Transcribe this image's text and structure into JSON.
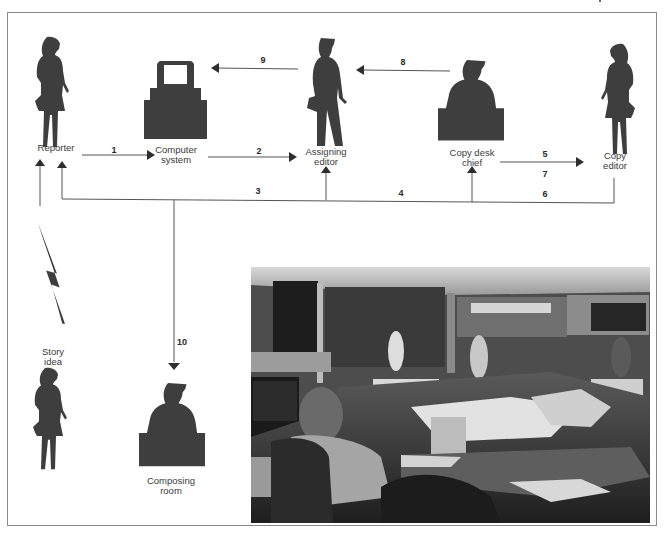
{
  "diagram": {
    "title": "",
    "colors": {
      "figure": "#3e3e3e",
      "line": "#555555",
      "border": "#8a8a8a"
    },
    "nodes": [
      {
        "id": "reporter",
        "label": "Reporter",
        "icon": "woman-silhouette"
      },
      {
        "id": "computer",
        "label": "Computer\nsystem",
        "icon": "computer-terminal"
      },
      {
        "id": "assigning",
        "label": "Assigning\neditor",
        "icon": "man-silhouette"
      },
      {
        "id": "copychief",
        "label": "Copy desk\nchief",
        "icon": "man-at-desk"
      },
      {
        "id": "copyeditor",
        "label": "Copy\neditor",
        "icon": "woman-silhouette"
      },
      {
        "id": "story",
        "label": "Story\nidea",
        "icon": "lightning-bolt"
      },
      {
        "id": "composing",
        "label": "Composing\nroom",
        "icon": "man-at-desk"
      }
    ],
    "edges": [
      {
        "num": "1",
        "from": "Reporter",
        "to": "Computer system"
      },
      {
        "num": "2",
        "from": "Computer system",
        "to": "Assigning editor"
      },
      {
        "num": "3",
        "from": "Assigning editor",
        "to": "Reporter"
      },
      {
        "num": "4",
        "from": "Copy desk chief",
        "to": "Reporter"
      },
      {
        "num": "5",
        "from": "Copy desk chief",
        "to": "Copy editor"
      },
      {
        "num": "6",
        "from": "Copy editor",
        "to": "Reporter / Assigning editor / Copy desk chief"
      },
      {
        "num": "7",
        "from": "Copy desk chief",
        "to": "Copy editor"
      },
      {
        "num": "8",
        "from": "Copy desk chief",
        "to": "Assigning editor"
      },
      {
        "num": "9",
        "from": "Assigning editor",
        "to": "Computer system"
      },
      {
        "num": "10",
        "from": "Feedback line",
        "to": "Composing room"
      }
    ]
  },
  "photo": {
    "description": "Black-and-white photograph of a busy newsroom with a woman seated at a cluttered desk"
  }
}
